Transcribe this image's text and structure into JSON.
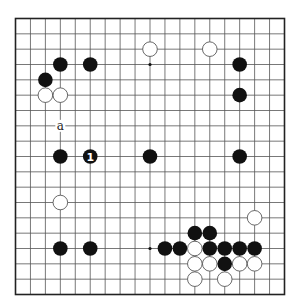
{
  "diagram": {
    "type": "go-board",
    "size": 19,
    "colors": {
      "board": "#ffffff",
      "line": "#555555",
      "border": "#222222",
      "black": "#111111",
      "white_fill": "#ffffff",
      "white_stroke": "#444444"
    },
    "star_points": [
      [
        3,
        3
      ],
      [
        3,
        9
      ],
      [
        3,
        15
      ],
      [
        9,
        3
      ],
      [
        9,
        9
      ],
      [
        9,
        15
      ],
      [
        15,
        3
      ],
      [
        15,
        9
      ],
      [
        15,
        15
      ]
    ],
    "black_stones": [
      {
        "col": 3,
        "row": 3
      },
      {
        "col": 5,
        "row": 3
      },
      {
        "col": 2,
        "row": 4
      },
      {
        "col": 15,
        "row": 3
      },
      {
        "col": 15,
        "row": 5
      },
      {
        "col": 3,
        "row": 9
      },
      {
        "col": 5,
        "row": 9,
        "label": "1"
      },
      {
        "col": 9,
        "row": 9
      },
      {
        "col": 15,
        "row": 9
      },
      {
        "col": 3,
        "row": 15
      },
      {
        "col": 5,
        "row": 15
      },
      {
        "col": 12,
        "row": 14
      },
      {
        "col": 13,
        "row": 14
      },
      {
        "col": 10,
        "row": 15
      },
      {
        "col": 11,
        "row": 15
      },
      {
        "col": 13,
        "row": 15
      },
      {
        "col": 14,
        "row": 15
      },
      {
        "col": 15,
        "row": 15
      },
      {
        "col": 16,
        "row": 15
      },
      {
        "col": 14,
        "row": 16
      }
    ],
    "white_stones": [
      {
        "col": 2,
        "row": 5
      },
      {
        "col": 3,
        "row": 5
      },
      {
        "col": 9,
        "row": 2
      },
      {
        "col": 13,
        "row": 2
      },
      {
        "col": 3,
        "row": 12
      },
      {
        "col": 16,
        "row": 13
      },
      {
        "col": 12,
        "row": 15
      },
      {
        "col": 12,
        "row": 16
      },
      {
        "col": 13,
        "row": 16
      },
      {
        "col": 15,
        "row": 16
      },
      {
        "col": 16,
        "row": 16
      },
      {
        "col": 12,
        "row": 17
      },
      {
        "col": 14,
        "row": 17
      }
    ],
    "markers": [
      {
        "col": 3,
        "row": 7,
        "label": "a"
      }
    ]
  }
}
